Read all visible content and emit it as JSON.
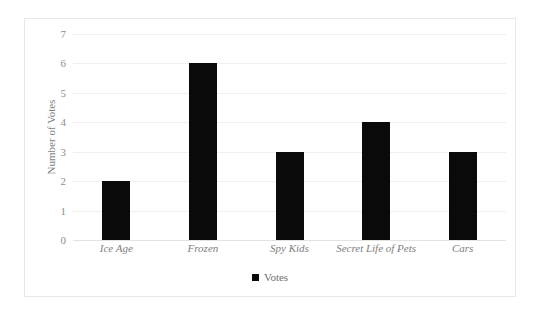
{
  "chart_data": {
    "type": "bar",
    "title": "",
    "xlabel": "",
    "ylabel": "Number of Votes",
    "categories": [
      "Ice Age",
      "Frozen",
      "Spy Kids",
      "Secret Life of Pets",
      "Cars"
    ],
    "values": [
      2,
      6,
      3,
      4,
      3
    ],
    "series": [
      {
        "name": "Votes",
        "values": [
          2,
          6,
          3,
          4,
          3
        ]
      }
    ],
    "ylim": [
      0,
      7
    ],
    "ytick_labels": [
      "7",
      "6",
      "5",
      "4",
      "3",
      "2",
      "1",
      "0"
    ],
    "ytick_values": [
      7,
      6,
      5,
      4,
      3,
      2,
      1,
      0
    ],
    "grid": true,
    "legend": {
      "position": "bottom-center",
      "entries": [
        "Votes"
      ]
    },
    "colors": {
      "bar": "#0a0a0a",
      "gridline": "#efefef",
      "axis": "#e3e3e3",
      "tick_text": "#8d8d8d",
      "category_text": "#7e7e7e",
      "legend_text": "#6f6f6f",
      "border": "#e8e8e8",
      "background": "#ffffff"
    }
  },
  "legend": {
    "swatch_icon": "black-square-marker",
    "label": "Votes"
  }
}
